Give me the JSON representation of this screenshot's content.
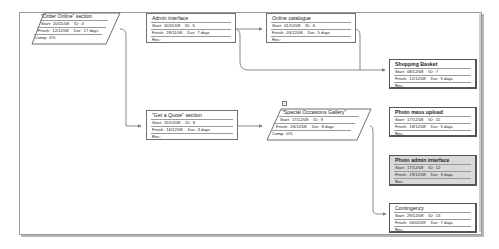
{
  "diagram": {
    "type": "network-diagram",
    "nodes": [
      {
        "id": "order-online",
        "title": "\"Order Online\" section",
        "start": "20/11/08",
        "task_id": "4",
        "finish": "12/12/08",
        "dur": "17 days",
        "extra_label": "Comp:",
        "extra_value": "0%",
        "kind": "summary"
      },
      {
        "id": "admin-interface",
        "title": "Admin interface",
        "start": "20/11/08",
        "task_id": "5",
        "finish": "28/11/08",
        "dur": "7 days",
        "extra_label": "Res:",
        "extra_value": "",
        "kind": "task"
      },
      {
        "id": "online-catalogue",
        "title": "Online catalogue",
        "start": "01/12/08",
        "task_id": "6",
        "finish": "05/12/08",
        "dur": "5 days",
        "extra_label": "Res:",
        "extra_value": "",
        "kind": "task"
      },
      {
        "id": "shopping-basket",
        "title": "Shopping Basket",
        "start": "08/12/08",
        "task_id": "7",
        "finish": "12/12/08",
        "dur": "5 days",
        "extra_label": "Res:",
        "extra_value": "",
        "kind": "critical"
      },
      {
        "id": "get-a-quote",
        "title": "\"Get a Quote\" section",
        "start": "15/12/08",
        "task_id": "8",
        "finish": "16/12/08",
        "dur": "3 days",
        "extra_label": "Res:",
        "extra_value": "",
        "kind": "task"
      },
      {
        "id": "special-occasions",
        "title": "\"Special Occasions Gallery\"",
        "start": "17/12/08",
        "task_id": "9",
        "finish": "26/12/08",
        "dur": "8 days",
        "extra_label": "Comp:",
        "extra_value": "0%",
        "kind": "summary"
      },
      {
        "id": "photo-mass-upload",
        "title": "Photo mass upload",
        "start": "17/12/08",
        "task_id": "11",
        "finish": "18/12/08",
        "dur": "5 days",
        "extra_label": "Res:",
        "extra_value": "",
        "kind": "critical"
      },
      {
        "id": "photo-admin-interface",
        "title": "Photo admin interface",
        "start": "17/12/08",
        "task_id": "12",
        "finish": "19/12/08",
        "dur": "3 days",
        "extra_label": "Res:",
        "extra_value": "",
        "kind": "critical-shaded"
      },
      {
        "id": "contingency",
        "title": "Contingency",
        "start": "29/12/08",
        "task_id": "13",
        "finish": "06/01/09",
        "dur": "7 days",
        "extra_label": "Res:",
        "extra_value": "",
        "kind": "critical"
      }
    ],
    "labels": {
      "start": "Start:",
      "id": "ID:",
      "finish": "Finish:",
      "dur": "Dur:"
    },
    "collapse_symbol": "−",
    "colors": {
      "border": "#6f6f6f",
      "critical_border": "#555555",
      "shaded": "#d9d9d9",
      "line": "#8a8a8a"
    }
  }
}
